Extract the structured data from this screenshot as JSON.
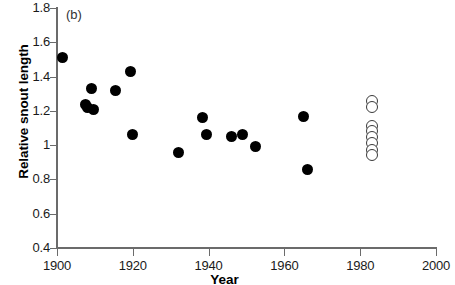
{
  "figure": {
    "panel_label": "(b)",
    "x_axis_title": "Year",
    "y_axis_title": "Relative snout length"
  },
  "chart_data": {
    "type": "scatter",
    "title": "",
    "panel": "(b)",
    "xlabel": "Year",
    "ylabel": "Relative snout length",
    "xlim": [
      1900,
      2000
    ],
    "ylim": [
      0.4,
      1.8
    ],
    "xticks": [
      1900,
      1920,
      1940,
      1960,
      1980,
      2000
    ],
    "xticklabels": [
      "1900",
      "1920",
      "1940",
      "1960",
      "1980",
      "2000"
    ],
    "yticks": [
      0.4,
      0.6,
      0.8,
      1.0,
      1.2,
      1.4,
      1.6,
      1.8
    ],
    "yticklabels": [
      "0.4",
      "0.6",
      "0.8",
      "1",
      "1.2",
      "1.4",
      "1.6",
      "1.8"
    ],
    "grid": false,
    "legend": false,
    "series": [
      {
        "name": "historical specimens",
        "marker": "filled-circle",
        "color": "#000000",
        "points": [
          {
            "x": 1901.5,
            "y": 1.51
          },
          {
            "x": 1907.5,
            "y": 1.24
          },
          {
            "x": 1908.0,
            "y": 1.22
          },
          {
            "x": 1909.0,
            "y": 1.33
          },
          {
            "x": 1909.5,
            "y": 1.21
          },
          {
            "x": 1915.5,
            "y": 1.32
          },
          {
            "x": 1919.5,
            "y": 1.43
          },
          {
            "x": 1920.0,
            "y": 1.06
          },
          {
            "x": 1932.0,
            "y": 0.96
          },
          {
            "x": 1938.5,
            "y": 1.16
          },
          {
            "x": 1939.5,
            "y": 1.06
          },
          {
            "x": 1946.0,
            "y": 1.05
          },
          {
            "x": 1949.0,
            "y": 1.06
          },
          {
            "x": 1952.5,
            "y": 0.99
          },
          {
            "x": 1965.0,
            "y": 1.17
          },
          {
            "x": 1966.0,
            "y": 0.86
          }
        ]
      },
      {
        "name": "modern specimens",
        "marker": "open-circle",
        "color": "#3a3a3a",
        "points": [
          {
            "x": 1983.0,
            "y": 1.26
          },
          {
            "x": 1983.0,
            "y": 1.22
          },
          {
            "x": 1983.0,
            "y": 1.11
          },
          {
            "x": 1983.0,
            "y": 1.08
          },
          {
            "x": 1983.0,
            "y": 1.05
          },
          {
            "x": 1983.0,
            "y": 1.01
          },
          {
            "x": 1983.0,
            "y": 0.97
          },
          {
            "x": 1983.0,
            "y": 0.94
          }
        ]
      }
    ]
  }
}
